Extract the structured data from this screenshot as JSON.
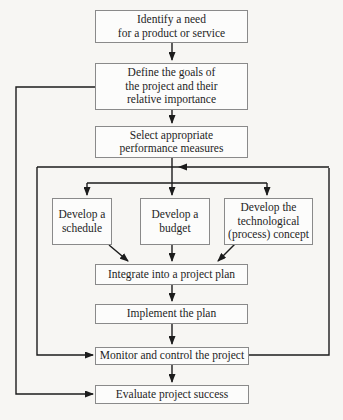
{
  "diagram": {
    "type": "flowchart",
    "boxes": {
      "identify": "Identify a need\nfor a product or service",
      "define": "Define the goals of\nthe project and their\nrelative importance",
      "select": "Select appropriate\nperformance measures",
      "schedule": "Develop a\nschedule",
      "budget": "Develop a\nbudget",
      "tech": "Develop the\ntechnological\n(process) concept",
      "integrate": "Integrate into a project plan",
      "implement": "Implement the plan",
      "monitor": "Monitor and control the project",
      "evaluate": "Evaluate project success"
    },
    "colors": {
      "line": "#1c1c1c",
      "box_border": "#8a8a8a",
      "box_fill": "#fcfcfb",
      "text": "#1e1e1e",
      "background": "#f7f6f3"
    }
  }
}
